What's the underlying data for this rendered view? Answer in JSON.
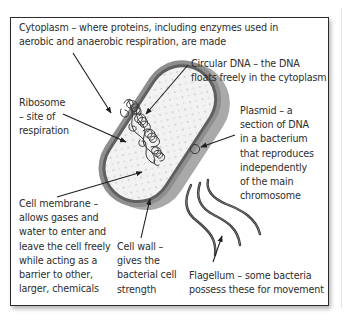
{
  "diagram": {
    "subject": "Bacterial cell",
    "labels": {
      "cytoplasm": "Cytoplasm – where proteins, including enzymes used in\naerobic and anaerobic respiration, are made",
      "circular_dna": "Circular DNA – the DNA\nfloats freely in the cytoplasm",
      "ribosome": "Ribosome\n– site of\nrespiration",
      "plasmid": "Plasmid – a\nsection of DNA\nin a bacterium\nthat reproduces\nindependently\nof the main\nchromosome",
      "cell_membrane": "Cell membrane –\nallows gases and\nwater to enter and\nleave the cell freely\nwhile acting as a\nbarrier to other,\nlarger, chemicals",
      "cell_wall": "Cell wall –\ngives the\nbacterial cell\nstrength",
      "flagellum": "Flagellum – some bacteria\npossess these for movement"
    },
    "colors": {
      "frame_border": "#2b2b2b",
      "cell_wall_outer": "#8c8c8c",
      "cell_wall_side": "#a9a9a9",
      "membrane_band": "#5e5e5e",
      "cytoplasm_fill": "#f1f1f1",
      "dna_stroke": "#3a3a3a",
      "text": "#2d2d2d"
    }
  }
}
